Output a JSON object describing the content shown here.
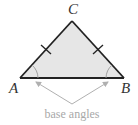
{
  "diagram": {
    "type": "isosceles-triangle",
    "vertices": {
      "A": {
        "label": "A",
        "x": 20,
        "y": 78
      },
      "B": {
        "label": "B",
        "x": 124,
        "y": 78
      },
      "C": {
        "label": "C",
        "x": 72,
        "y": 21
      }
    },
    "caption": "base angles",
    "colors": {
      "fill": "#e6e6e6",
      "stroke": "#222222",
      "arrow": "#b0b0b0",
      "caption": "#a8a8a8"
    },
    "congruent_sides": [
      "AC",
      "BC"
    ],
    "marked_angles": [
      "A",
      "B"
    ]
  }
}
